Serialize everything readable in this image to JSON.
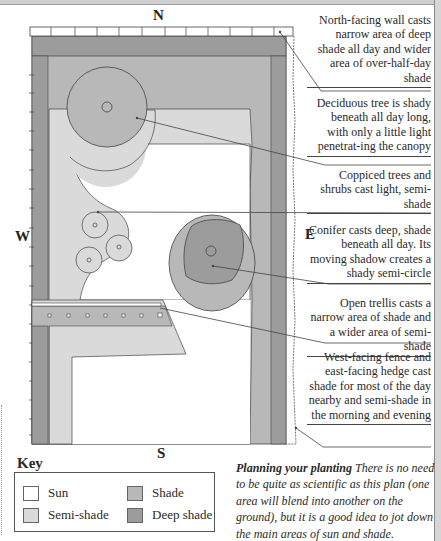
{
  "compass": {
    "north": "N",
    "south": "S",
    "east": "E",
    "west": "W"
  },
  "colors": {
    "sun": "#ffffff",
    "semi_shade": "#dadada",
    "shade": "#b8b8b8",
    "deep_shade": "#9c9c9c",
    "outline": "#444444"
  },
  "notes": [
    {
      "id": "north-wall",
      "text": "North-facing wall casts narrow area of deep shade all day and wider area of over-half-day shade"
    },
    {
      "id": "deciduous-tree",
      "text": "Deciduous tree is shady beneath all day long, with only a little light penetrat-ing the canopy"
    },
    {
      "id": "coppiced-trees",
      "text": "Coppiced trees and shrubs cast light, semi-shade"
    },
    {
      "id": "conifer",
      "text": "Conifer casts deep, shade beneath all day. Its moving shadow creates a shady semi-circle"
    },
    {
      "id": "trellis",
      "text": "Open trellis casts a narrow area of shade and a wider area of semi-shade"
    },
    {
      "id": "fence-hedge",
      "text": "West-facing fence and east-facing hedge cast shade for most of the day nearby and semi-shade in the morning and evening"
    }
  ],
  "key": {
    "title": "Key",
    "items": [
      {
        "label": "Sun",
        "color": "#ffffff"
      },
      {
        "label": "Shade",
        "color": "#b8b8b8"
      },
      {
        "label": "Semi-shade",
        "color": "#dadada"
      },
      {
        "label": "Deep shade",
        "color": "#9c9c9c"
      }
    ]
  },
  "caption": {
    "heading": "Planning your planting",
    "body": " There is no need to be quite as scientific as this plan (one area will blend into another on the ground), but it is a good idea to jot down the main areas of sun and shade."
  }
}
